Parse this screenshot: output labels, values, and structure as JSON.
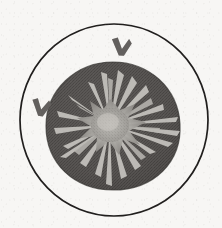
{
  "figure": {
    "canvas": {
      "width": 222,
      "height": 228
    },
    "background_color": "#f7f6f4",
    "ink_color": "#1f1d1c",
    "elements": {
      "outer_circle": {
        "label": "outer-circle",
        "shape": "circle",
        "center_x": 114,
        "center_y": 120,
        "radius_x": 94,
        "radius_y": 96,
        "stroke_color": "#201e1d",
        "stroke_width": 1.7,
        "fill": "none"
      },
      "dark_blob": {
        "label": "dark-halftone-blob",
        "shape": "squircle",
        "center_x": 113,
        "center_y": 126,
        "radius_x": 67,
        "radius_y": 64,
        "fill_color": "#555250",
        "edge_color": "#3c3a38"
      },
      "starburst": {
        "label": "central-starburst",
        "shape": "radial-spikes",
        "center_x": 110,
        "center_y": 125,
        "core_radius": 18,
        "core_color": "#a8a6a1",
        "spike_color": "#c3c1bc",
        "spike_count": 26,
        "max_spike_length": 62
      },
      "markers": [
        {
          "label": "check-marker-top",
          "name": "chevron-marker-top",
          "x": 122,
          "y": 46,
          "size": 20,
          "rotation": -8,
          "color": "#6b6866"
        },
        {
          "label": "check-marker-left",
          "name": "chevron-marker-left",
          "x": 42,
          "y": 107,
          "size": 19,
          "rotation": -4,
          "color": "#6b6866"
        }
      ]
    }
  }
}
